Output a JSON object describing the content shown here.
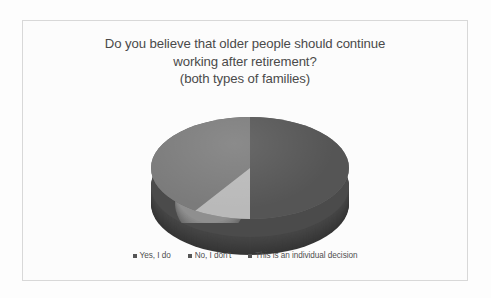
{
  "chart_data": {
    "type": "pie",
    "title": "Do you believe that older people should continue working after retirement? (both types of families)",
    "title_lines": [
      "Do you believe that older people should continue",
      "working after retirement?",
      "(both types of families)"
    ],
    "categories": [
      "Yes, I do",
      "No, I don't",
      "This is an individual decision"
    ],
    "values": [
      50,
      12,
      38
    ],
    "colors": [
      "#555555",
      "#b9b9b9",
      "#7b7b7b"
    ],
    "legend_position": "bottom",
    "three_d": true,
    "grid": false,
    "xlabel": "",
    "ylabel": ""
  },
  "legend": {
    "items": [
      {
        "label": "Yes, I do"
      },
      {
        "label": "No, I don't"
      },
      {
        "label": "This is an individual decision"
      }
    ]
  }
}
